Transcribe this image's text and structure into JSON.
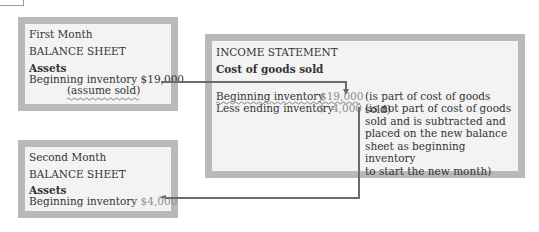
{
  "first_month": {
    "period": "First Month",
    "title": "BALANCE SHEET",
    "section": "Assets",
    "item_label": "Beginning inventory",
    "item_value": "$19,000",
    "item_note": "(assume sold)"
  },
  "income_statement": {
    "title": "INCOME STATEMENT",
    "section": "Cost of goods sold",
    "rows": [
      {
        "label": "Beginning inventory",
        "value": "$19,000",
        "note": "(is part of cost of goods sold)"
      },
      {
        "label": "Less ending inventory",
        "value": "$  4,000",
        "note": "(is not part of cost of goods\nsold and is subtracted and\nplaced on the new balance\nsheet as beginning inventory\nto start the new month)"
      }
    ]
  },
  "second_month": {
    "period": "Second Month",
    "title": "BALANCE SHEET",
    "section": "Assets",
    "item_label": "Beginning inventory",
    "item_value": "$4,000"
  },
  "colors": {
    "border": "#b9b9b9",
    "fill": "#f3f3f3",
    "text": "#333333",
    "muted_value": "#8d8d8d",
    "connector": "#6b6b6b"
  }
}
